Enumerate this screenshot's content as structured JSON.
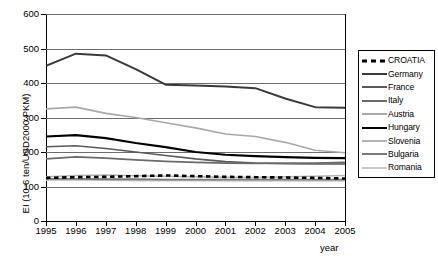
{
  "chart_data": {
    "type": "line",
    "title": "",
    "xlabel": "year",
    "ylabel": "EI (10-6 ten/USD2000 PKM)",
    "x": [
      1995,
      1996,
      1997,
      1998,
      1999,
      2000,
      2001,
      2002,
      2003,
      2004,
      2005
    ],
    "xticklabels": [
      "1995",
      "1996",
      "1997",
      "1998",
      "1999",
      "2000",
      "2001",
      "2002",
      "2003",
      "2004",
      "2005"
    ],
    "yticklabels": [
      "0",
      "100",
      "200",
      "300",
      "400",
      "500",
      "600"
    ],
    "ylim": [
      0,
      600
    ],
    "ytick_step": 100,
    "xlim": [
      1995,
      2005
    ],
    "grid": true,
    "legend_position": "right-outside",
    "series": [
      {
        "name": "CROATIA",
        "style": "dashed",
        "color": "#000000",
        "width": 2.6,
        "values": [
          125,
          127,
          128,
          130,
          132,
          130,
          128,
          127,
          126,
          125,
          123
        ]
      },
      {
        "name": "Germany",
        "style": "solid",
        "color": "#3a3a3a",
        "width": 2.0,
        "values": [
          450,
          485,
          480,
          440,
          395,
          393,
          390,
          385,
          355,
          330,
          328
        ]
      },
      {
        "name": "France",
        "style": "solid",
        "color": "#5a5a5a",
        "width": 1.6,
        "values": [
          215,
          218,
          210,
          200,
          190,
          180,
          172,
          168,
          166,
          165,
          165
        ]
      },
      {
        "name": "Italy",
        "style": "solid",
        "color": "#6a6a6a",
        "width": 1.8,
        "values": [
          180,
          186,
          182,
          177,
          173,
          170,
          168,
          167,
          168,
          168,
          170
        ]
      },
      {
        "name": "Austria",
        "style": "solid",
        "color": "#a8a8a8",
        "width": 1.6,
        "values": [
          325,
          330,
          312,
          300,
          285,
          270,
          252,
          245,
          228,
          205,
          198
        ]
      },
      {
        "name": "Hungary",
        "style": "solid",
        "color": "#000000",
        "width": 2.2,
        "values": [
          245,
          249,
          240,
          226,
          214,
          200,
          192,
          188,
          185,
          183,
          182
        ]
      },
      {
        "name": "Slovenia",
        "style": "solid",
        "color": "#b5b5b5",
        "width": 1.5,
        "values": [
          128,
          132,
          133,
          131,
          130,
          128,
          127,
          126,
          128,
          130,
          132
        ]
      },
      {
        "name": "Bulgaria",
        "style": "solid",
        "color": "#7a7a7a",
        "width": 1.8,
        "values": [
          122,
          122,
          121,
          121,
          120,
          120,
          120,
          120,
          120,
          120,
          120
        ]
      },
      {
        "name": "Romania",
        "style": "solid",
        "color": "#c9c9c9",
        "width": 1.5,
        "values": [
          118,
          118,
          118,
          117,
          117,
          117,
          116,
          116,
          116,
          116,
          116
        ]
      }
    ]
  },
  "legend": {
    "entries": [
      {
        "label": "CROATIA"
      },
      {
        "label": "Germany"
      },
      {
        "label": "France"
      },
      {
        "label": "Italy"
      },
      {
        "label": "Austria"
      },
      {
        "label": "Hungary"
      },
      {
        "label": "Slovenia"
      },
      {
        "label": "Bulgaria"
      },
      {
        "label": "Romania"
      }
    ]
  },
  "axes": {
    "y_title": "EI (10-6 ten/USD2000 PKM)",
    "x_title": "year"
  }
}
